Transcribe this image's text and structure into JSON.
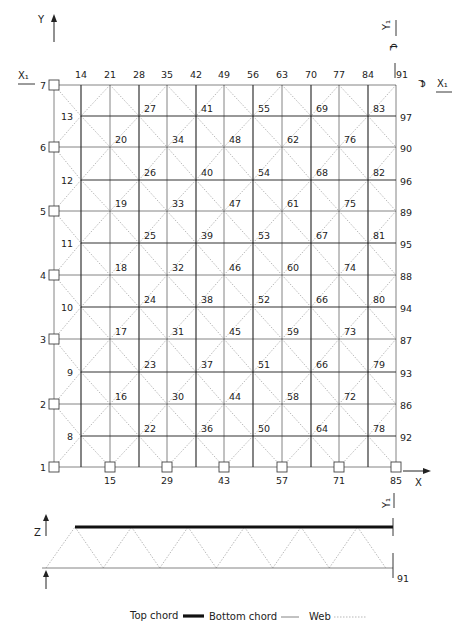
{
  "figure": {
    "plan": {
      "axes": {
        "x_label": "X",
        "y_label": "Y",
        "x1_label": "X₁",
        "y1_label": "Y₁",
        "centerline_symbol": "℄"
      },
      "geometry": {
        "left_x": 54,
        "right_x": 396,
        "top_y": 85,
        "bottom_y": 467,
        "col_xs": [
          54,
          81,
          110,
          139,
          167,
          196,
          224,
          253,
          282,
          311,
          339,
          368,
          396
        ],
        "outer_row_ys": [
          85,
          147,
          211,
          275,
          339,
          404,
          467
        ],
        "inner_row_ys": [
          116,
          180,
          243,
          307,
          372,
          436
        ]
      },
      "left_support_nodes": [
        {
          "label": "7",
          "y": 85
        },
        {
          "label": "6",
          "y": 147
        },
        {
          "label": "5",
          "y": 211
        },
        {
          "label": "4",
          "y": 275
        },
        {
          "label": "3",
          "y": 339
        },
        {
          "label": "2",
          "y": 404
        },
        {
          "label": "1",
          "y": 467
        }
      ],
      "inner_left_nodes": [
        {
          "label": "13",
          "y": 116
        },
        {
          "label": "12",
          "y": 180
        },
        {
          "label": "11",
          "y": 243
        },
        {
          "label": "10",
          "y": 307
        },
        {
          "label": "9",
          "y": 372
        },
        {
          "label": "8",
          "y": 436
        }
      ],
      "top_labels": [
        {
          "label": "14",
          "x": 81
        },
        {
          "label": "21",
          "x": 110
        },
        {
          "label": "28",
          "x": 139
        },
        {
          "label": "35",
          "x": 167
        },
        {
          "label": "42",
          "x": 196
        },
        {
          "label": "49",
          "x": 224
        },
        {
          "label": "56",
          "x": 253
        },
        {
          "label": "63",
          "x": 282
        },
        {
          "label": "70",
          "x": 311
        },
        {
          "label": "77",
          "x": 339
        },
        {
          "label": "84",
          "x": 368
        },
        {
          "label": "91",
          "x": 396
        }
      ],
      "bottom_support_nodes": [
        {
          "label": "15",
          "x": 110
        },
        {
          "label": "29",
          "x": 167
        },
        {
          "label": "43",
          "x": 224
        },
        {
          "label": "57",
          "x": 282
        },
        {
          "label": "71",
          "x": 339
        },
        {
          "label": "85",
          "x": 396
        }
      ],
      "right_labels": [
        {
          "label": "97",
          "y": 116
        },
        {
          "label": "90",
          "y": 147
        },
        {
          "label": "96",
          "y": 180
        },
        {
          "label": "89",
          "y": 211
        },
        {
          "label": "95",
          "y": 243
        },
        {
          "label": "88",
          "y": 275
        },
        {
          "label": "94",
          "y": 307
        },
        {
          "label": "87",
          "y": 339
        },
        {
          "label": "93",
          "y": 372
        },
        {
          "label": "86",
          "y": 404
        },
        {
          "label": "92",
          "y": 436
        }
      ],
      "interior_labels": [
        {
          "label": "27",
          "x": 139,
          "y": 116
        },
        {
          "label": "41",
          "x": 196,
          "y": 116
        },
        {
          "label": "55",
          "x": 253,
          "y": 116
        },
        {
          "label": "69",
          "x": 311,
          "y": 116
        },
        {
          "label": "83",
          "x": 368,
          "y": 116
        },
        {
          "label": "20",
          "x": 110,
          "y": 147
        },
        {
          "label": "34",
          "x": 167,
          "y": 147
        },
        {
          "label": "48",
          "x": 224,
          "y": 147
        },
        {
          "label": "62",
          "x": 282,
          "y": 147
        },
        {
          "label": "76",
          "x": 339,
          "y": 147
        },
        {
          "label": "26",
          "x": 139,
          "y": 180
        },
        {
          "label": "40",
          "x": 196,
          "y": 180
        },
        {
          "label": "54",
          "x": 253,
          "y": 180
        },
        {
          "label": "68",
          "x": 311,
          "y": 180
        },
        {
          "label": "82",
          "x": 368,
          "y": 180
        },
        {
          "label": "19",
          "x": 110,
          "y": 211
        },
        {
          "label": "33",
          "x": 167,
          "y": 211
        },
        {
          "label": "47",
          "x": 224,
          "y": 211
        },
        {
          "label": "61",
          "x": 282,
          "y": 211
        },
        {
          "label": "75",
          "x": 339,
          "y": 211
        },
        {
          "label": "25",
          "x": 139,
          "y": 243
        },
        {
          "label": "39",
          "x": 196,
          "y": 243
        },
        {
          "label": "53",
          "x": 253,
          "y": 243
        },
        {
          "label": "67",
          "x": 311,
          "y": 243
        },
        {
          "label": "81",
          "x": 368,
          "y": 243
        },
        {
          "label": "18",
          "x": 110,
          "y": 275
        },
        {
          "label": "32",
          "x": 167,
          "y": 275
        },
        {
          "label": "46",
          "x": 224,
          "y": 275
        },
        {
          "label": "60",
          "x": 282,
          "y": 275
        },
        {
          "label": "74",
          "x": 339,
          "y": 275
        },
        {
          "label": "24",
          "x": 139,
          "y": 307
        },
        {
          "label": "38",
          "x": 196,
          "y": 307
        },
        {
          "label": "52",
          "x": 253,
          "y": 307
        },
        {
          "label": "66",
          "x": 311,
          "y": 307
        },
        {
          "label": "80",
          "x": 368,
          "y": 307
        },
        {
          "label": "17",
          "x": 110,
          "y": 339
        },
        {
          "label": "31",
          "x": 167,
          "y": 339
        },
        {
          "label": "45",
          "x": 224,
          "y": 339
        },
        {
          "label": "59",
          "x": 282,
          "y": 339
        },
        {
          "label": "73",
          "x": 339,
          "y": 339
        },
        {
          "label": "23",
          "x": 139,
          "y": 372
        },
        {
          "label": "37",
          "x": 196,
          "y": 372
        },
        {
          "label": "51",
          "x": 253,
          "y": 372
        },
        {
          "label": "66",
          "x": 311,
          "y": 372
        },
        {
          "label": "79",
          "x": 368,
          "y": 372
        },
        {
          "label": "16",
          "x": 110,
          "y": 404
        },
        {
          "label": "30",
          "x": 167,
          "y": 404
        },
        {
          "label": "44",
          "x": 224,
          "y": 404
        },
        {
          "label": "58",
          "x": 282,
          "y": 404
        },
        {
          "label": "72",
          "x": 339,
          "y": 404
        },
        {
          "label": "22",
          "x": 139,
          "y": 436
        },
        {
          "label": "36",
          "x": 196,
          "y": 436
        },
        {
          "label": "50",
          "x": 253,
          "y": 436
        },
        {
          "label": "64",
          "x": 311,
          "y": 436
        },
        {
          "label": "78",
          "x": 368,
          "y": 436
        }
      ]
    },
    "elevation": {
      "z_label": "Z",
      "y1_label": "Y₁",
      "end_node_label": "91",
      "top_chord_y": 527,
      "bottom_chord_y": 568,
      "top_x_start": 75,
      "x_end": 393,
      "bottom_x_start": 42
    },
    "legend": {
      "top_chord": "Top chord",
      "bottom_chord": "Bottom chord",
      "web": "Web"
    }
  }
}
